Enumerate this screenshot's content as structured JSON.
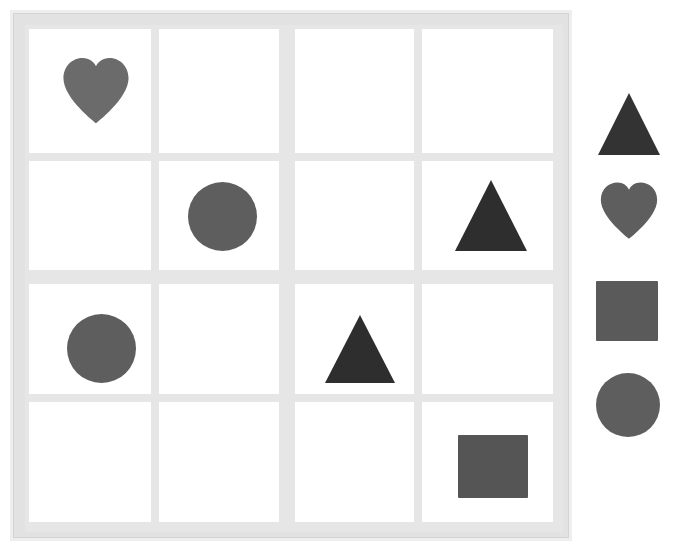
{
  "app": {
    "title": "Shape Grid Puzzle",
    "background_color": "#ffffff"
  },
  "board": {
    "name": "shape-grid",
    "rows": 4,
    "columns": 4,
    "frame_color": "#e2e2e2",
    "frame_highlight_color": "#eeeeee",
    "cell_color": "#ffffff",
    "divider_color": "#e6e6e6",
    "x": 10,
    "y": 10,
    "width": 562,
    "height": 531,
    "column_edges": [
      22,
      148,
      276,
      292,
      415,
      550
    ],
    "row_edges": [
      22,
      150,
      267,
      281,
      391,
      519
    ],
    "cells": [
      {
        "id": "cell-r1c1",
        "row": 1,
        "col": 1,
        "x": 26,
        "y": 26,
        "w": 122,
        "h": 124,
        "shape": "heart"
      },
      {
        "id": "cell-r1c2",
        "row": 1,
        "col": 2,
        "x": 156,
        "y": 26,
        "w": 120,
        "h": 124,
        "shape": null
      },
      {
        "id": "cell-r1c3",
        "row": 1,
        "col": 3,
        "x": 292,
        "y": 26,
        "w": 119,
        "h": 124,
        "shape": null
      },
      {
        "id": "cell-r1c4",
        "row": 1,
        "col": 4,
        "x": 419,
        "y": 26,
        "w": 131,
        "h": 124,
        "shape": null
      },
      {
        "id": "cell-r2c1",
        "row": 2,
        "col": 1,
        "x": 26,
        "y": 158,
        "w": 122,
        "h": 109,
        "shape": null
      },
      {
        "id": "cell-r2c2",
        "row": 2,
        "col": 2,
        "x": 156,
        "y": 158,
        "w": 120,
        "h": 109,
        "shape": "circle"
      },
      {
        "id": "cell-r2c3",
        "row": 2,
        "col": 3,
        "x": 292,
        "y": 158,
        "w": 119,
        "h": 109,
        "shape": null
      },
      {
        "id": "cell-r2c4",
        "row": 2,
        "col": 4,
        "x": 419,
        "y": 158,
        "w": 131,
        "h": 109,
        "shape": "triangle"
      },
      {
        "id": "cell-r3c1",
        "row": 3,
        "col": 1,
        "x": 26,
        "y": 281,
        "w": 122,
        "h": 110,
        "shape": "circle"
      },
      {
        "id": "cell-r3c2",
        "row": 3,
        "col": 2,
        "x": 156,
        "y": 281,
        "w": 120,
        "h": 110,
        "shape": null
      },
      {
        "id": "cell-r3c3",
        "row": 3,
        "col": 3,
        "x": 292,
        "y": 281,
        "w": 119,
        "h": 110,
        "shape": "triangle"
      },
      {
        "id": "cell-r3c4",
        "row": 3,
        "col": 4,
        "x": 419,
        "y": 281,
        "w": 131,
        "h": 110,
        "shape": null
      },
      {
        "id": "cell-r4c1",
        "row": 4,
        "col": 1,
        "x": 26,
        "y": 399,
        "w": 122,
        "h": 120,
        "shape": null
      },
      {
        "id": "cell-r4c2",
        "row": 4,
        "col": 2,
        "x": 156,
        "y": 399,
        "w": 120,
        "h": 120,
        "shape": null
      },
      {
        "id": "cell-r4c3",
        "row": 4,
        "col": 3,
        "x": 292,
        "y": 399,
        "w": 119,
        "h": 120,
        "shape": null
      },
      {
        "id": "cell-r4c4",
        "row": 4,
        "col": 4,
        "x": 419,
        "y": 399,
        "w": 131,
        "h": 120,
        "shape": "square"
      }
    ],
    "placed_shapes": [
      {
        "id": "grid-heart-1",
        "shape": "heart",
        "cell": "cell-r1c1",
        "color": "#6b6b6b",
        "x": 56,
        "y": 52,
        "w": 74,
        "h": 72
      },
      {
        "id": "grid-circle-1",
        "shape": "circle",
        "cell": "cell-r2c2",
        "color": "#5e5e5e",
        "x": 185,
        "y": 179,
        "w": 69,
        "h": 69
      },
      {
        "id": "grid-triangle-1",
        "shape": "triangle",
        "cell": "cell-r2c4",
        "color": "#2e2e2e",
        "x": 452,
        "y": 177,
        "w": 73,
        "h": 71
      },
      {
        "id": "grid-circle-2",
        "shape": "circle",
        "cell": "cell-r3c1",
        "color": "#5e5e5e",
        "x": 64,
        "y": 311,
        "w": 69,
        "h": 69
      },
      {
        "id": "grid-triangle-2",
        "shape": "triangle",
        "cell": "cell-r3c3",
        "color": "#2e2e2e",
        "x": 322,
        "y": 312,
        "w": 70,
        "h": 68
      },
      {
        "id": "grid-square-1",
        "shape": "square",
        "cell": "cell-r4c4",
        "color": "#555555",
        "x": 455,
        "y": 432,
        "w": 70,
        "h": 63
      }
    ]
  },
  "palette": {
    "name": "shape-palette",
    "x": 588,
    "y": 80,
    "width": 86,
    "height": 365,
    "items": [
      {
        "id": "palette-triangle",
        "shape": "triangle",
        "label": "triangle",
        "color": "#333333",
        "x": 598,
        "y": 93,
        "w": 62,
        "h": 62
      },
      {
        "id": "palette-heart",
        "shape": "heart",
        "label": "heart",
        "color": "#5e5e5e",
        "x": 597,
        "y": 180,
        "w": 64,
        "h": 62
      },
      {
        "id": "palette-square",
        "shape": "square",
        "label": "square",
        "color": "#5a5a5a",
        "x": 596,
        "y": 281,
        "w": 62,
        "h": 60
      },
      {
        "id": "palette-circle",
        "shape": "circle",
        "label": "circle",
        "color": "#5e5e5e",
        "x": 596,
        "y": 373,
        "w": 64,
        "h": 64
      }
    ]
  }
}
